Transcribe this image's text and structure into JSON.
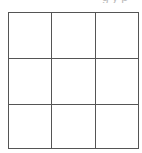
{
  "header": {
    "partial_text": "g y p"
  },
  "board": {
    "rows": 3,
    "cols": 3,
    "cells": [
      [
        "",
        "",
        ""
      ],
      [
        "",
        "",
        ""
      ],
      [
        "",
        "",
        ""
      ]
    ]
  }
}
